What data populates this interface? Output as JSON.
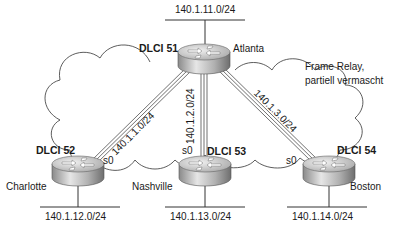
{
  "diagram": {
    "cloud_label": [
      "Frame Relay,",
      "partiell vermascht"
    ],
    "routers": [
      {
        "name": "Atlanta",
        "dlci": "DLCI 51",
        "lan": "140.1.11.0/24"
      },
      {
        "name": "Charlotte",
        "dlci": "DLCI 52",
        "interface": "s0",
        "lan": "140.1.12.0/24"
      },
      {
        "name": "Nashville",
        "dlci": "DLCI 53",
        "interface": "s0",
        "lan": "140.1.13.0/24"
      },
      {
        "name": "Boston",
        "dlci": "DLCI 54",
        "interface": "s0",
        "lan": "140.1.14.0/24"
      }
    ],
    "links": [
      {
        "from": "Atlanta",
        "to": "Charlotte",
        "subnet": "140.1.1.0/24"
      },
      {
        "from": "Atlanta",
        "to": "Nashville",
        "subnet": "140.1.2.0/24"
      },
      {
        "from": "Atlanta",
        "to": "Boston",
        "subnet": "140.1.3.0/24"
      }
    ],
    "colors": {
      "line": "#333333",
      "router_top": "#d9d9d9",
      "router_side": "#9a9a9a"
    }
  }
}
